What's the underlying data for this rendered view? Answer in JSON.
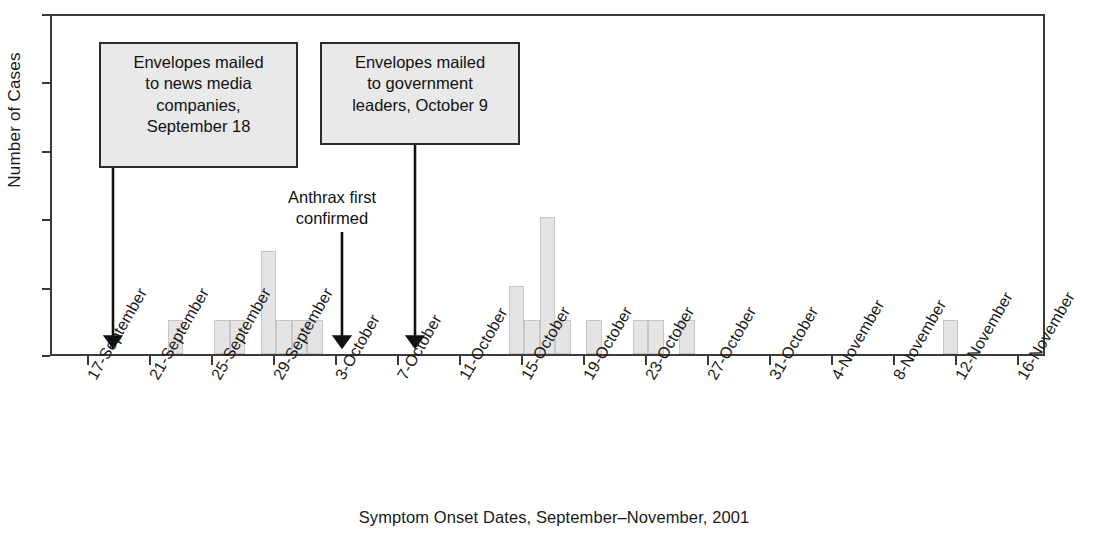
{
  "chart_data": {
    "type": "bar",
    "title": "",
    "xlabel": "Symptom Onset Dates, September–November, 2001",
    "ylabel": "Number of Cases",
    "ylim": [
      0,
      10
    ],
    "y_ticks": [
      0,
      2,
      4,
      6,
      8,
      10
    ],
    "grid": false,
    "legend": "none",
    "x_tick_labels": [
      "17-September",
      "21-September",
      "25-September",
      "29-September",
      "3-October",
      "7-October",
      "11-October",
      "15-October",
      "19-October",
      "23-October",
      "27-October",
      "31-October",
      "4-November",
      "8-November",
      "12-November",
      "16-November"
    ],
    "x_axis_start_date": "17-September",
    "x_axis_end_date": "18-November",
    "bin_width_days": 1,
    "categories": [
      "22-September",
      "25-September",
      "26-September",
      "28-September",
      "29-September",
      "30-September",
      "1-October",
      "14-October",
      "15-October",
      "16-October",
      "17-October",
      "19-October",
      "22-October",
      "23-October",
      "25-October",
      "11-November"
    ],
    "values": [
      1,
      1,
      1,
      3,
      1,
      1,
      1,
      2,
      1,
      4,
      1,
      1,
      1,
      1,
      1,
      1
    ],
    "bar_fill_color": "#e4e4e4",
    "bar_edge_color": "#c6c6c6",
    "axis_color": "#3a3a3a"
  },
  "annotations": [
    {
      "id": "news-media-callout",
      "type": "boxed",
      "lines": [
        "Envelopes mailed",
        "to news media",
        "companies,",
        "September 18"
      ],
      "points_to": "18-September",
      "has_arrow": true
    },
    {
      "id": "government-leaders-callout",
      "type": "boxed",
      "lines": [
        "Envelopes mailed",
        "to government",
        "leaders, October 9"
      ],
      "points_to": "9-October",
      "has_arrow": true
    },
    {
      "id": "anthrax-first-confirmed-note",
      "type": "plain",
      "lines": [
        "Anthrax first",
        "confirmed"
      ],
      "points_to": "4-October",
      "has_arrow": true
    }
  ]
}
